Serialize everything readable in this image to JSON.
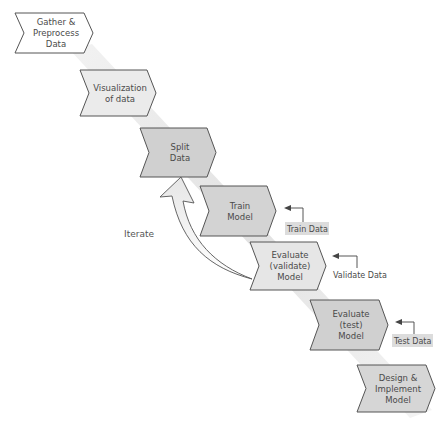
{
  "diagram": {
    "steps": [
      {
        "id": "gather",
        "lines": [
          "Gather &",
          "Preprocess",
          "Data"
        ],
        "fill": "#ffffff"
      },
      {
        "id": "visualization",
        "lines": [
          "Visualization",
          "of data"
        ],
        "fill": "#ebebeb"
      },
      {
        "id": "split",
        "lines": [
          "Split",
          "Data"
        ],
        "fill": "#d0d0d0"
      },
      {
        "id": "train",
        "lines": [
          "Train",
          "Model"
        ],
        "fill": "#d3d3d3"
      },
      {
        "id": "validate",
        "lines": [
          "Evaluate",
          "(validate)",
          "Model"
        ],
        "fill": "#e6e6e6"
      },
      {
        "id": "test",
        "lines": [
          "Evaluate",
          "(test)",
          "Model"
        ],
        "fill": "#d0d0d0"
      },
      {
        "id": "design",
        "lines": [
          "Design &",
          "Implement",
          "Model"
        ],
        "fill": "#d6d6d6"
      }
    ],
    "data_inputs": [
      {
        "id": "train-data",
        "label": "Train Data",
        "target": "train",
        "boxed": true
      },
      {
        "id": "validate-data",
        "label": "Validate Data",
        "target": "validate",
        "boxed": false
      },
      {
        "id": "test-data",
        "label": "Test Data",
        "target": "test",
        "boxed": true
      }
    ],
    "iterate_label": "Iterate",
    "colors": {
      "stroke": "#555555",
      "band": "#e4e4e4",
      "label_box": "#dcdcdc",
      "text": "#4a4a4a"
    }
  }
}
